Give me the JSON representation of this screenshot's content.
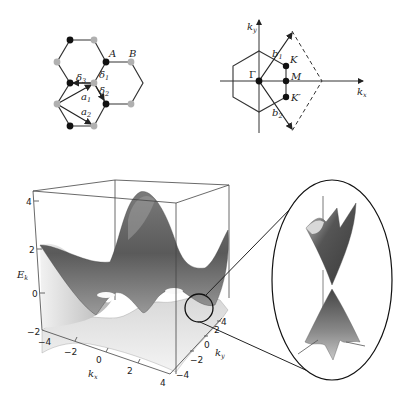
{
  "lattice": {
    "label_A": "A",
    "label_B": "B",
    "delta1": "δ",
    "delta1_sub": "1",
    "delta2": "δ",
    "delta2_sub": "2",
    "delta3": "δ",
    "delta3_sub": "3",
    "a1": "a",
    "a1_sub": "1",
    "a2": "a",
    "a2_sub": "2",
    "sublattice_colors": {
      "A": "#111111",
      "B": "#b0b0b0"
    }
  },
  "reciprocal": {
    "kx": "k",
    "kx_sub": "x",
    "ky": "k",
    "ky_sub": "y",
    "gamma": "Γ",
    "K": "K",
    "M": "M",
    "Kprime": "K′",
    "b1": "b",
    "b1_sub": "1",
    "b2": "b",
    "b2_sub": "2"
  },
  "band_plot": {
    "zlabel": "E",
    "zlabel_sub": "k",
    "xlabel": "k",
    "xlabel_sub": "x",
    "ylabel": "k",
    "ylabel_sub": "y",
    "z_ticks": [
      "4",
      "2",
      "0",
      "−2"
    ],
    "x_ticks": [
      "−4",
      "−2",
      "0",
      "2",
      "4"
    ],
    "y_ticks": [
      "4",
      "2",
      "0",
      "−2",
      "−4"
    ]
  },
  "inset": {
    "description": "Dirac cone zoom at K point"
  }
}
